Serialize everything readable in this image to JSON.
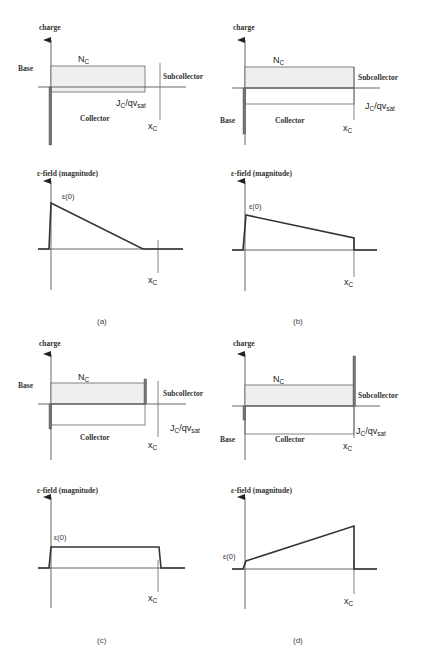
{
  "panels": {
    "a": {
      "caption": "(a)",
      "charge": {
        "axis_label": "charge",
        "base_label": "Base",
        "doping_label": "N",
        "doping_sub": "C",
        "subcollector_label": "Subcollector",
        "collector_label": "Collector",
        "current_label": "J",
        "current_sub1": "C",
        "current_mid": "/qv",
        "current_sub2": "sat",
        "width_label": "x",
        "width_sub": "C"
      },
      "field": {
        "axis_label": "ε-field (magnitude)",
        "peak_label": "ε(0)",
        "width_label": "x",
        "width_sub": "C"
      }
    },
    "b": {
      "caption": "(b)",
      "charge": {
        "axis_label": "charge",
        "base_label": "Base",
        "doping_label": "N",
        "doping_sub": "C",
        "subcollector_label": "Subcollector",
        "collector_label": "Collector",
        "current_label": "J",
        "current_sub1": "C",
        "current_mid": "/qv",
        "current_sub2": "sat",
        "width_label": "x",
        "width_sub": "C"
      },
      "field": {
        "axis_label": "ε-field (magnitude)",
        "peak_label": "ε(0)",
        "width_label": "x",
        "width_sub": "C"
      }
    },
    "c": {
      "caption": "(c)",
      "charge": {
        "axis_label": "charge",
        "base_label": "Base",
        "doping_label": "N",
        "doping_sub": "C",
        "subcollector_label": "Subcollector",
        "collector_label": "Collector",
        "current_label": "J",
        "current_sub1": "C",
        "current_mid": "/qv",
        "current_sub2": "sat",
        "width_label": "x",
        "width_sub": "C"
      },
      "field": {
        "axis_label": "ε-field (magnitude)",
        "peak_label": "ε(0)",
        "width_label": "x",
        "width_sub": "C"
      }
    },
    "d": {
      "caption": "(d)",
      "charge": {
        "axis_label": "charge",
        "base_label": "Base",
        "doping_label": "N",
        "doping_sub": "C",
        "subcollector_label": "Subcollector",
        "collector_label": "Collector",
        "current_label": "J",
        "current_sub1": "C",
        "current_mid": "/qv",
        "current_sub2": "sat",
        "width_label": "x",
        "width_sub": "C"
      },
      "field": {
        "axis_label": "ε-field (magnitude)",
        "peak_label": "ε(0)",
        "width_label": "x",
        "width_sub": "C"
      }
    }
  },
  "colors": {
    "line": "#333333",
    "axis": "#555555",
    "fill": "#efefef",
    "spike": "#777777"
  }
}
